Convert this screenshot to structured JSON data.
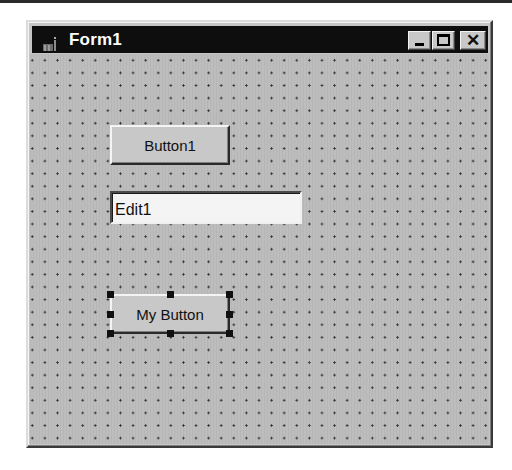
{
  "window": {
    "title": "Form1",
    "icon": "form-icon",
    "controls": {
      "minimize": "minimize-icon",
      "maximize": "maximize-icon",
      "close": "close-icon",
      "close_glyph": "✕"
    }
  },
  "form": {
    "grid": "dotted design grid",
    "controls": [
      {
        "type": "button",
        "label": "Button1",
        "selected": false
      },
      {
        "type": "edit",
        "value": "Edit1"
      },
      {
        "type": "button",
        "label": "My Button",
        "selected": true
      }
    ]
  },
  "colors": {
    "titlebar": "#0e0e0e",
    "title_text": "#ffffff",
    "form_bg": "#bdbdbd",
    "selection_handle": "#111111"
  }
}
